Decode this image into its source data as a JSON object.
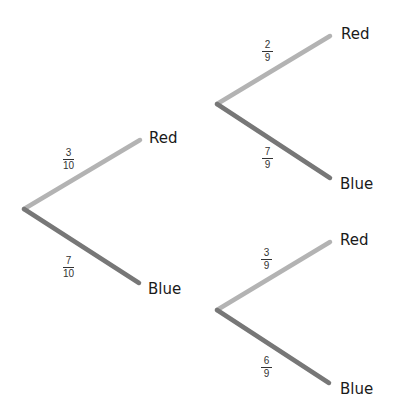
{
  "diagram": {
    "type": "probability-tree",
    "colors": {
      "red_branch": "#b3b3b3",
      "blue_branch": "#777777",
      "text": "#1a1a1a"
    },
    "stage1": {
      "red": {
        "label": "Red",
        "prob_num": "3",
        "prob_den": "10"
      },
      "blue": {
        "label": "Blue",
        "prob_num": "7",
        "prob_den": "10"
      }
    },
    "stage2_after_red": {
      "red": {
        "label": "Red",
        "prob_num": "2",
        "prob_den": "9"
      },
      "blue": {
        "label": "Blue",
        "prob_num": "7",
        "prob_den": "9"
      }
    },
    "stage2_after_blue": {
      "red": {
        "label": "Red",
        "prob_num": "3",
        "prob_den": "9"
      },
      "blue": {
        "label": "Blue",
        "prob_num": "6",
        "prob_den": "9"
      }
    }
  }
}
